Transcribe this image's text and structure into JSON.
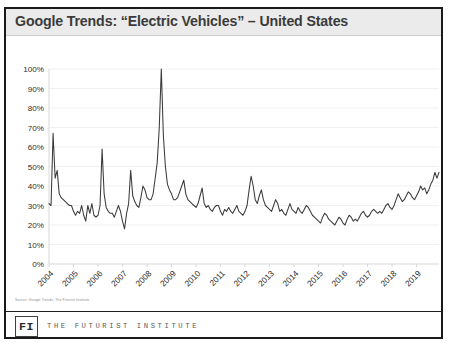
{
  "title": "Google Trends: “Electric Vehicles” – United States",
  "source_note": "Source:  Google Trends, The Futurist Institute",
  "footer": {
    "logo_label": "FI",
    "organization": "THE FUTURIST INSTITUTE"
  },
  "colors": {
    "line": "#3a3a3a",
    "grid": "#ededed",
    "title_band": "#ebebeb",
    "frame": "#1a1a1a",
    "tick_text": "#2e2e2e"
  },
  "chart_data": {
    "type": "line",
    "title": "Google Trends: “Electric Vehicles” – United States",
    "xlabel": "",
    "ylabel": "",
    "ylim": [
      0,
      100
    ],
    "xlim": [
      2004,
      2019.92
    ],
    "grid": true,
    "legend": null,
    "yticks": [
      0,
      10,
      20,
      30,
      40,
      50,
      60,
      70,
      80,
      90,
      100
    ],
    "ytick_labels": [
      "0%",
      "10%",
      "20%",
      "30%",
      "40%",
      "50%",
      "60%",
      "70%",
      "80%",
      "90%",
      "100%"
    ],
    "xticks": [
      2004,
      2005,
      2006,
      2007,
      2008,
      2009,
      2010,
      2011,
      2012,
      2013,
      2014,
      2015,
      2016,
      2017,
      2018,
      2019
    ],
    "xtick_labels": [
      "2004",
      "2005",
      "2006",
      "2007",
      "2008",
      "2009",
      "2010",
      "2011",
      "2012",
      "2013",
      "2014",
      "2015",
      "2016",
      "2017",
      "2018",
      "2019"
    ],
    "series": [
      {
        "name": "Electric Vehicles – United States",
        "units": "percent of peak search interest",
        "frequency": "monthly",
        "start": "2004-01",
        "values": [
          31,
          30,
          67,
          44,
          48,
          36,
          34,
          33,
          32,
          31,
          30,
          30,
          27,
          25,
          27,
          26,
          30,
          25,
          22,
          30,
          26,
          31,
          25,
          24,
          25,
          30,
          59,
          36,
          29,
          27,
          26,
          26,
          24,
          27,
          30,
          27,
          22,
          18,
          26,
          31,
          48,
          35,
          32,
          30,
          29,
          34,
          40,
          38,
          34,
          33,
          33,
          36,
          44,
          52,
          70,
          100,
          66,
          50,
          41,
          38,
          36,
          33,
          33,
          34,
          37,
          40,
          43,
          36,
          33,
          32,
          31,
          30,
          29,
          31,
          35,
          39,
          31,
          29,
          30,
          28,
          27,
          29,
          30,
          30,
          27,
          25,
          28,
          27,
          29,
          27,
          26,
          28,
          30,
          27,
          26,
          25,
          27,
          30,
          38,
          45,
          40,
          33,
          31,
          35,
          38,
          33,
          30,
          29,
          28,
          27,
          30,
          33,
          31,
          27,
          28,
          26,
          25,
          28,
          31,
          28,
          27,
          26,
          29,
          27,
          26,
          28,
          30,
          29,
          27,
          25,
          24,
          23,
          22,
          21,
          24,
          26,
          25,
          23,
          22,
          21,
          20,
          22,
          24,
          23,
          21,
          20,
          23,
          25,
          24,
          22,
          23,
          22,
          24,
          26,
          27,
          25,
          24,
          25,
          27,
          28,
          27,
          26,
          27,
          26,
          28,
          30,
          31,
          29,
          28,
          30,
          33,
          36,
          34,
          32,
          33,
          35,
          37,
          36,
          34,
          33,
          35,
          37,
          40,
          38,
          39,
          36,
          38,
          41,
          43,
          47,
          44,
          47
        ]
      }
    ],
    "annotations": [
      {
        "label": "peak",
        "x": "2008-08",
        "y": 100
      },
      {
        "label": "trough",
        "x": "2015-02",
        "y": 20
      },
      {
        "label": "final",
        "x": "2019-12",
        "y": 47
      }
    ]
  }
}
